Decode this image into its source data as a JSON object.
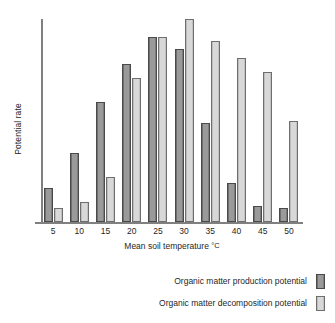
{
  "chart_data": {
    "type": "bar",
    "title": "",
    "xlabel": "Mean soil temperature °C",
    "ylabel": "Potential rate",
    "categories": [
      "5",
      "10",
      "15",
      "20",
      "25",
      "30",
      "35",
      "40",
      "45",
      "50"
    ],
    "series": [
      {
        "name": "Organic matter production potential",
        "color": "#8e8e8e",
        "values": [
          17,
          34,
          59,
          78,
          91,
          85,
          49,
          19,
          8,
          7
        ]
      },
      {
        "name": "Organic matter decomposition potential",
        "color": "#cdcdcd",
        "values": [
          7,
          10,
          22,
          71,
          91,
          100,
          89,
          81,
          74,
          50
        ]
      }
    ],
    "ylim": [
      0,
      100
    ],
    "y_ticks_shown": false,
    "grid": false,
    "legend_position": "bottom-right"
  },
  "axes": {
    "y_axis_label": "Potential rate",
    "x_axis_label_prefix": "Mean soil temperature ",
    "x_axis_label_unit": "°C",
    "x_tick_labels": [
      "5",
      "10",
      "15",
      "20",
      "25",
      "30",
      "35",
      "40",
      "45",
      "50"
    ]
  },
  "legend": {
    "entries": [
      {
        "label": "Organic matter production potential",
        "swatch": "dark-gray-bar-swatch"
      },
      {
        "label": "Organic matter decomposition potential",
        "swatch": "light-gray-bar-swatch"
      }
    ]
  },
  "colors": {
    "production_bar": "#8e8e8e",
    "decomposition_bar": "#cdcdcd",
    "axis_line": "#808080",
    "text": "#1f1f1f",
    "background": "#ffffff"
  }
}
